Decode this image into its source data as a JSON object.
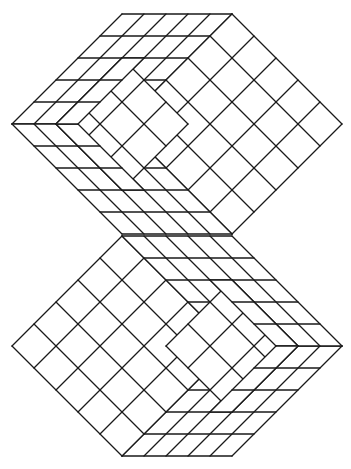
{
  "figure": {
    "title": "",
    "background": "#ffffff",
    "stroke": "#1a1a1a",
    "unit": 22,
    "cells": 5,
    "blocks": [
      {
        "name": "top-block",
        "origin": [
          122,
          14
        ],
        "rotate180": false,
        "inner": {
          "origin_cells": [
            1,
            1
          ],
          "size": 3
        }
      },
      {
        "name": "bottom-block",
        "origin": [
          122,
          14
        ],
        "rotate180": true,
        "inner": {
          "origin_cells": [
            1,
            1
          ],
          "size": 3
        }
      }
    ],
    "rotation_center": [
      177,
      235
    ]
  }
}
